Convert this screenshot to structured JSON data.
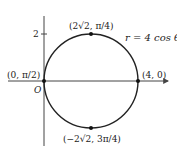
{
  "figure": {
    "equation": "r = 4 cos θ",
    "origin_label": "O",
    "y_tick_label": "2",
    "points": [
      {
        "name": "top",
        "label": "(2√2, π/4)"
      },
      {
        "name": "left",
        "label": "(0, π/2)"
      },
      {
        "name": "right",
        "label": "(4, 0)"
      },
      {
        "name": "bottom",
        "label": "(−2√2, 3π/4)"
      }
    ]
  },
  "colors": {
    "curve": "#222222",
    "axis": "#444444",
    "text": "#222222"
  }
}
